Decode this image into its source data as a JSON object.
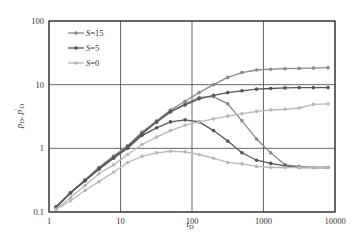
{
  "chart_data": {
    "type": "line",
    "title": "",
    "xlabel": "t_D",
    "ylabel": "p_D, p'_D",
    "xscale": "log",
    "yscale": "log",
    "xlim": [
      1,
      10000
    ],
    "ylim": [
      0.1,
      100
    ],
    "x_ticks": [
      "1",
      "10",
      "100",
      "1000",
      "10000"
    ],
    "y_ticks": [
      "0.1",
      "1",
      "10",
      "100"
    ],
    "grid": true,
    "legend_position": "upper left",
    "legend": [
      "S=15",
      "S=5",
      "S=0"
    ],
    "x": [
      1.26,
      2,
      3.2,
      5,
      8,
      12.6,
      20,
      32,
      50,
      80,
      126,
      200,
      316,
      500,
      800,
      1260,
      2000,
      3160,
      5000,
      8000
    ],
    "series": [
      {
        "name": "S=15 pD",
        "legend": "S=15",
        "color": "#8a8a8a",
        "values": [
          0.12,
          0.2,
          0.32,
          0.5,
          0.75,
          1.1,
          1.8,
          2.7,
          4.0,
          5.5,
          7.5,
          10,
          13,
          15.5,
          17,
          17.5,
          17.8,
          18,
          18.2,
          18.5
        ]
      },
      {
        "name": "S=15 p'D",
        "legend": "S=15",
        "color": "#8a8a8a",
        "values": [
          0.12,
          0.2,
          0.32,
          0.5,
          0.75,
          1.1,
          1.75,
          2.6,
          3.7,
          5.0,
          6.3,
          6.5,
          5.0,
          2.7,
          1.4,
          0.85,
          0.55,
          0.52,
          0.5,
          0.5
        ]
      },
      {
        "name": "S=5 pD",
        "legend": "S=5",
        "color": "#555555",
        "values": [
          0.12,
          0.2,
          0.31,
          0.48,
          0.72,
          1.05,
          1.7,
          2.6,
          3.8,
          4.8,
          6.0,
          6.8,
          7.5,
          8.0,
          8.5,
          8.7,
          8.9,
          9.0,
          9.0,
          9.0
        ]
      },
      {
        "name": "S=5 p'D",
        "legend": "S=5",
        "color": "#555555",
        "values": [
          0.12,
          0.2,
          0.31,
          0.47,
          0.7,
          1.0,
          1.6,
          2.1,
          2.6,
          2.8,
          2.6,
          1.9,
          1.3,
          0.85,
          0.65,
          0.58,
          0.53,
          0.5,
          0.5,
          0.5
        ]
      },
      {
        "name": "S=0 pD",
        "legend": "S=0",
        "color": "#b8b8b8",
        "values": [
          0.11,
          0.17,
          0.26,
          0.4,
          0.55,
          0.8,
          1.15,
          1.5,
          1.9,
          2.3,
          2.6,
          2.9,
          3.2,
          3.5,
          3.8,
          4.0,
          4.1,
          4.3,
          4.9,
          5.0
        ]
      },
      {
        "name": "S=0 p'D",
        "legend": "S=0",
        "color": "#b8b8b8",
        "values": [
          0.11,
          0.15,
          0.22,
          0.3,
          0.42,
          0.6,
          0.75,
          0.85,
          0.9,
          0.88,
          0.8,
          0.7,
          0.6,
          0.57,
          0.52,
          0.5,
          0.5,
          0.5,
          0.5,
          0.5
        ]
      }
    ]
  },
  "labels": {
    "xlabel_main": "t",
    "xlabel_sub": "D",
    "ylabel_text": "p",
    "ylabel_sub": "D",
    "ylabel_sep": ",  ",
    "ylabel_text2": "p",
    "ylabel_sup2": "′",
    "ylabel_sub2": "D"
  }
}
